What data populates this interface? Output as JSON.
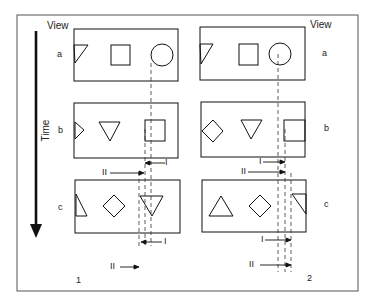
{
  "figure": {
    "panels": [
      {
        "id": "panel-1",
        "number": "1"
      },
      {
        "id": "panel-2",
        "number": "2"
      }
    ],
    "view_label": "View",
    "time_label": "Time",
    "rows": [
      {
        "view": "a"
      },
      {
        "view": "b"
      },
      {
        "view": "c"
      }
    ],
    "markers": {
      "one": "I",
      "two": "II"
    },
    "panel_1_rows": [
      {
        "view": "a",
        "shapes": [
          "partial-triangle-left-edge",
          "square",
          "circle"
        ]
      },
      {
        "view": "b",
        "shapes": [
          "partial-triangle-left-edge",
          "triangle-down",
          "square"
        ]
      },
      {
        "view": "c",
        "shapes": [
          "partial-triangle-left-edge",
          "diamond",
          "triangle-down"
        ]
      }
    ],
    "panel_2_rows": [
      {
        "view": "a",
        "shapes": [
          "partial-triangle-left-edge",
          "square",
          "circle"
        ]
      },
      {
        "view": "b",
        "shapes": [
          "diamond",
          "triangle-down",
          "partial-square-right-edge"
        ]
      },
      {
        "view": "c",
        "shapes": [
          "triangle-up",
          "diamond",
          "partial-triangle-right-edge"
        ]
      }
    ],
    "colors": {
      "ink": "#1a1a1a",
      "frame": "#555555",
      "background": "#ffffff"
    }
  }
}
